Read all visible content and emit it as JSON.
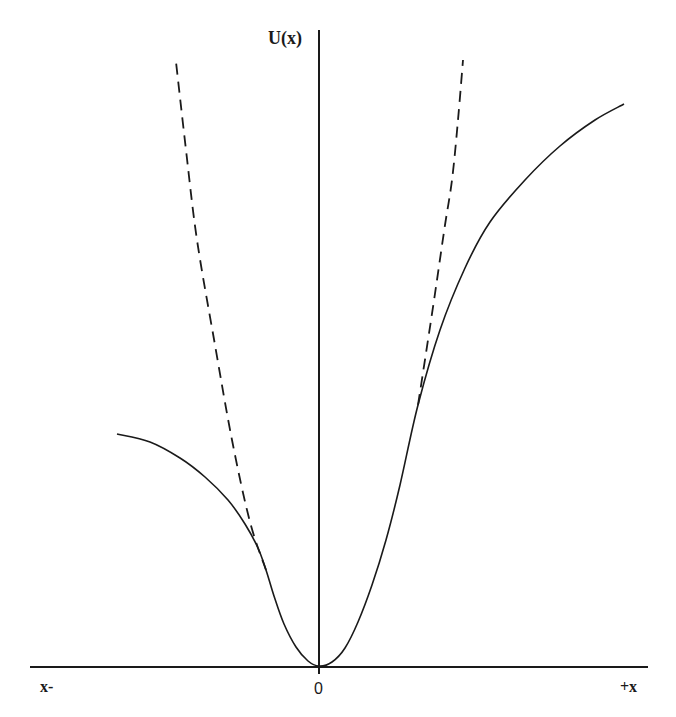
{
  "chart_data": {
    "type": "line",
    "title": "",
    "xlabel_left": "x-",
    "xlabel_right": "+x",
    "ylabel": "U(x)",
    "origin_label": "0",
    "grid": false,
    "legend": null,
    "series": [
      {
        "name": "potential U(x) (solid)",
        "style": "solid",
        "description": "Asymmetric potential well with minimum at x=0; rises faster on the left, saturating at lower level; on the right rises higher and flattens",
        "points_px": [
          [
            117,
            434
          ],
          [
            150,
            442
          ],
          [
            180,
            458
          ],
          [
            205,
            477
          ],
          [
            228,
            500
          ],
          [
            245,
            524
          ],
          [
            258,
            548
          ],
          [
            266,
            570
          ],
          [
            274,
            596
          ],
          [
            284,
            624
          ],
          [
            296,
            647
          ],
          [
            308,
            661
          ],
          [
            319,
            666
          ],
          [
            332,
            662
          ],
          [
            345,
            648
          ],
          [
            358,
            622
          ],
          [
            372,
            585
          ],
          [
            386,
            540
          ],
          [
            400,
            485
          ],
          [
            418,
            405
          ],
          [
            440,
            330
          ],
          [
            465,
            268
          ],
          [
            490,
            222
          ],
          [
            525,
            180
          ],
          [
            560,
            146
          ],
          [
            595,
            120
          ],
          [
            624,
            104
          ]
        ]
      },
      {
        "name": "harmonic approximation (dashed, left)",
        "style": "dashed",
        "points_px": [
          [
            266,
            570
          ],
          [
            250,
            522
          ],
          [
            232,
            440
          ],
          [
            215,
            345
          ],
          [
            197,
            240
          ],
          [
            186,
            150
          ],
          [
            176,
            62
          ]
        ]
      },
      {
        "name": "harmonic approximation (dashed, right)",
        "style": "dashed",
        "points_px": [
          [
            418,
            405
          ],
          [
            428,
            340
          ],
          [
            437,
            280
          ],
          [
            445,
            225
          ],
          [
            452,
            180
          ],
          [
            458,
            120
          ],
          [
            463,
            60
          ]
        ]
      }
    ],
    "axes": {
      "x_axis_px": {
        "x1": 30,
        "x2": 648,
        "y": 667
      },
      "y_axis_px": {
        "x": 319,
        "y1": 30,
        "y2": 674
      }
    }
  }
}
